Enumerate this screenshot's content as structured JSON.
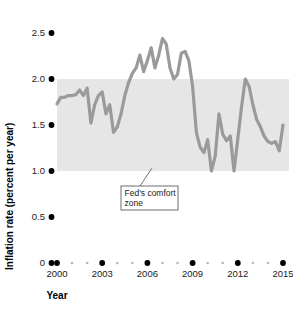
{
  "chart_data": {
    "type": "line",
    "title": "",
    "xlabel": "Year",
    "ylabel": "Inflation rate (percent per year)",
    "xlim": [
      1999.7,
      2015.4
    ],
    "ylim": [
      0,
      2.6
    ],
    "grid": false,
    "legend": "none",
    "line_color": "#9a9a9a",
    "band_color": "#e6e6e6",
    "y_ticks": [
      {
        "value": 2.5,
        "label": "2.5"
      },
      {
        "value": 2.0,
        "label": "2.0"
      },
      {
        "value": 1.5,
        "label": "1.5"
      },
      {
        "value": 1.0,
        "label": "1.0"
      },
      {
        "value": 0.5,
        "label": "0.5"
      },
      {
        "value": 0,
        "label": "0"
      }
    ],
    "x_ticks": [
      {
        "value": 2000,
        "label": "2000"
      },
      {
        "value": 2003,
        "label": "2003"
      },
      {
        "value": 2006,
        "label": "2006"
      },
      {
        "value": 2009,
        "label": "2009"
      },
      {
        "value": 2012,
        "label": "2012"
      },
      {
        "value": 2015,
        "label": "2015"
      }
    ],
    "x_minor_ticks": [
      2001,
      2002,
      2004,
      2005,
      2007,
      2008,
      2010,
      2011,
      2013,
      2014
    ],
    "bands": [
      {
        "name": "Fed's comfort zone",
        "y_low": 1.0,
        "y_high": 2.0,
        "x_start": 2000.0,
        "x_end": 2015.4
      }
    ],
    "annotations": [
      {
        "text_line1": "Fed's comfort",
        "text_line2": "zone",
        "target_x": 2006.3,
        "target_y": 1.03
      }
    ],
    "series": [
      {
        "name": "Inflation rate",
        "x": [
          2000.0,
          2000.25,
          2000.5,
          2000.75,
          2001.0,
          2001.25,
          2001.5,
          2001.75,
          2002.0,
          2002.25,
          2002.5,
          2002.75,
          2003.0,
          2003.25,
          2003.5,
          2003.75,
          2004.0,
          2004.25,
          2004.5,
          2004.75,
          2005.0,
          2005.25,
          2005.5,
          2005.75,
          2006.0,
          2006.25,
          2006.5,
          2006.75,
          2007.0,
          2007.25,
          2007.5,
          2007.75,
          2008.0,
          2008.25,
          2008.5,
          2008.75,
          2009.0,
          2009.25,
          2009.5,
          2009.75,
          2010.0,
          2010.25,
          2010.5,
          2010.75,
          2011.0,
          2011.25,
          2011.5,
          2011.75,
          2012.0,
          2012.25,
          2012.5,
          2012.75,
          2013.0,
          2013.25,
          2013.5,
          2013.75,
          2014.0,
          2014.25,
          2014.5,
          2014.75,
          2015.0
        ],
        "values": [
          1.73,
          1.8,
          1.8,
          1.82,
          1.82,
          1.83,
          1.88,
          1.82,
          1.9,
          1.52,
          1.72,
          1.82,
          1.86,
          1.62,
          1.72,
          1.42,
          1.48,
          1.62,
          1.82,
          1.96,
          2.06,
          2.12,
          2.26,
          2.08,
          2.2,
          2.34,
          2.12,
          2.26,
          2.44,
          2.38,
          2.12,
          2.0,
          2.05,
          2.28,
          2.3,
          2.2,
          1.92,
          1.42,
          1.26,
          1.2,
          1.34,
          1.0,
          1.16,
          1.62,
          1.4,
          1.33,
          1.38,
          1.0,
          1.35,
          1.7,
          2.0,
          1.92,
          1.72,
          1.56,
          1.48,
          1.38,
          1.32,
          1.3,
          1.32,
          1.22,
          1.5
        ]
      }
    ]
  }
}
